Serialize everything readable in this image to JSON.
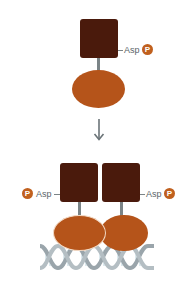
{
  "diagram": {
    "top": {
      "residue_label": "Asp",
      "phospho_label": "P"
    },
    "arrow": "↓",
    "bottom": {
      "left": {
        "residue_label": "Asp",
        "phospho_label": "P"
      },
      "right": {
        "residue_label": "Asp",
        "phospho_label": "P"
      }
    }
  },
  "colors": {
    "receiver_domain": "#4a1a0c",
    "dna_binding_domain": "#b5541a",
    "phosphate": "#c0601e",
    "linker": "#7b8487",
    "dna": "#9aa5ab"
  }
}
